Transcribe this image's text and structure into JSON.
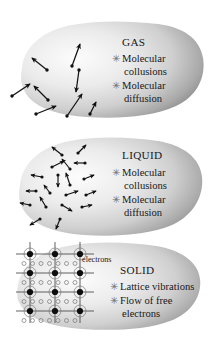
{
  "figure": {
    "title_semantic": "states-of-matter-heat-transfer-mechanisms",
    "background_color": "#ffffff",
    "blob_fill_light": "#f2f2f2",
    "blob_fill_dark": "#8d8d8d",
    "particle_color": "#111111",
    "bullet_glyph": "✳"
  },
  "panels": [
    {
      "id": "gas",
      "heading": "GAS",
      "bullets": [
        {
          "mark": "✳",
          "lines": [
            "Molecular",
            "collusions"
          ]
        },
        {
          "mark": "✳",
          "lines": [
            "Molecular",
            "diffusion"
          ]
        }
      ],
      "particle_model": "free-fast-arrows",
      "particle_count": 8,
      "arrows": [
        {
          "x1": 47,
          "y1": 52,
          "x2": 32,
          "y2": 40
        },
        {
          "x1": 72,
          "y1": 48,
          "x2": 80,
          "y2": 26
        },
        {
          "x1": 48,
          "y1": 82,
          "x2": 34,
          "y2": 68
        },
        {
          "x1": 79,
          "y1": 52,
          "x2": 76,
          "y2": 74
        },
        {
          "x1": 12,
          "y1": 78,
          "x2": 30,
          "y2": 66
        },
        {
          "x1": 36,
          "y1": 96,
          "x2": 56,
          "y2": 88
        },
        {
          "x1": 67,
          "y1": 98,
          "x2": 82,
          "y2": 76
        },
        {
          "x1": 90,
          "y1": 96,
          "x2": 96,
          "y2": 84
        }
      ]
    },
    {
      "id": "liquid",
      "heading": "LIQUID",
      "bullets": [
        {
          "mark": "✳",
          "lines": [
            "Molecular",
            "collusions"
          ]
        },
        {
          "mark": "✳",
          "lines": [
            "Molecular",
            "diffusion"
          ]
        }
      ],
      "particle_model": "dense-short-arrows",
      "particle_count": 19,
      "arrows": [
        {
          "x1": 62,
          "y1": 22,
          "x2": 52,
          "y2": 14
        },
        {
          "x1": 78,
          "y1": 20,
          "x2": 86,
          "y2": 12
        },
        {
          "x1": 52,
          "y1": 34,
          "x2": 64,
          "y2": 28
        },
        {
          "x1": 70,
          "y1": 36,
          "x2": 62,
          "y2": 26
        },
        {
          "x1": 85,
          "y1": 30,
          "x2": 74,
          "y2": 30
        },
        {
          "x1": 42,
          "y1": 44,
          "x2": 31,
          "y2": 42
        },
        {
          "x1": 58,
          "y1": 42,
          "x2": 58,
          "y2": 54
        },
        {
          "x1": 70,
          "y1": 52,
          "x2": 66,
          "y2": 40
        },
        {
          "x1": 84,
          "y1": 46,
          "x2": 94,
          "y2": 42
        },
        {
          "x1": 36,
          "y1": 58,
          "x2": 26,
          "y2": 58
        },
        {
          "x1": 50,
          "y1": 60,
          "x2": 44,
          "y2": 52
        },
        {
          "x1": 66,
          "y1": 62,
          "x2": 78,
          "y2": 58
        },
        {
          "x1": 86,
          "y1": 62,
          "x2": 96,
          "y2": 58
        },
        {
          "x1": 30,
          "y1": 72,
          "x2": 20,
          "y2": 70
        },
        {
          "x1": 46,
          "y1": 74,
          "x2": 40,
          "y2": 64
        },
        {
          "x1": 62,
          "y1": 72,
          "x2": 72,
          "y2": 78
        },
        {
          "x1": 82,
          "y1": 74,
          "x2": 92,
          "y2": 72
        },
        {
          "x1": 40,
          "y1": 86,
          "x2": 30,
          "y2": 92
        },
        {
          "x1": 60,
          "y1": 86,
          "x2": 56,
          "y2": 96
        }
      ]
    },
    {
      "id": "solid",
      "heading": "SOLID",
      "label": "electrons",
      "bullets": [
        {
          "mark": "✳",
          "lines": [
            "Lattice vibrations"
          ]
        },
        {
          "mark": "✳",
          "lines": [
            "Flow of free",
            "electrons"
          ]
        }
      ],
      "particle_model": "fixed-lattice-with-free-electrons",
      "lattice": {
        "columns": 3,
        "rows": 4,
        "x_start": 30,
        "y_start": 14,
        "x_step": 25,
        "y_step": 19,
        "atom_radius": 3.1,
        "ring_radius": 6.0,
        "electron_radius": 2.0,
        "electron_rows": 4,
        "electron_cols": 7,
        "electron_x_start": 24,
        "electron_y_offset": 9.5,
        "electron_x_step": 8.5
      }
    }
  ]
}
